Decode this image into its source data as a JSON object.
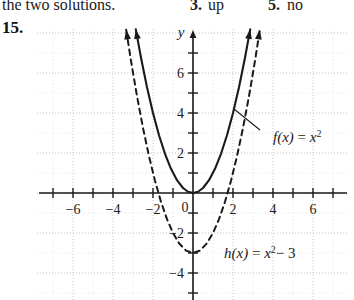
{
  "answer_key": {
    "trailing_text": "the two solutions.",
    "items": [
      {
        "number": "3.",
        "answer": "up"
      },
      {
        "number": "5.",
        "answer": "no"
      }
    ]
  },
  "exercise": {
    "number": "15."
  },
  "chart_data": {
    "type": "line",
    "title": "",
    "xlabel": "",
    "ylabel": "y",
    "xlim": [
      -7.8,
      7.8
    ],
    "ylim": [
      -6.0,
      8.2
    ],
    "grid": true,
    "grid_style": "dotted",
    "grid_spacing": 1,
    "axis_arrows": [
      "y-up",
      "y-down"
    ],
    "xticks": [
      -7,
      -6,
      -5,
      -4,
      -3,
      -2,
      -1,
      1,
      2,
      3,
      4,
      5,
      6,
      7
    ],
    "yticks": [
      -5,
      -4,
      -3,
      -2,
      -1,
      1,
      2,
      3,
      4,
      5,
      6,
      7
    ],
    "xticklabels": [
      {
        "value": -6,
        "text": "−6"
      },
      {
        "value": -4,
        "text": "−4"
      },
      {
        "value": -2,
        "text": "−2"
      },
      {
        "value": 2,
        "text": "2"
      },
      {
        "value": 4,
        "text": "4"
      },
      {
        "value": 6,
        "text": "6"
      }
    ],
    "yticklabels": [
      {
        "value": 6,
        "text": "6"
      },
      {
        "value": 4,
        "text": "4"
      },
      {
        "value": 2,
        "text": "2"
      },
      {
        "value": -2,
        "text": "−2"
      },
      {
        "value": -4,
        "text": "−4"
      }
    ],
    "origin_label": "0",
    "yaxis_label": "y",
    "series": [
      {
        "name": "f",
        "equation": "f(x) = x²",
        "label_text_main": "f(x)  =  x",
        "label_text_sup": "2",
        "style": "solid",
        "color": "#1a1a1a",
        "vertex": [
          0,
          0
        ],
        "x": [
          -2.86,
          -2.6,
          -2.3,
          -2.0,
          -1.7,
          -1.4,
          -1.1,
          -0.8,
          -0.5,
          -0.25,
          0,
          0.25,
          0.5,
          0.8,
          1.1,
          1.4,
          1.7,
          2.0,
          2.3,
          2.6,
          2.86
        ],
        "y": [
          8.18,
          6.76,
          5.29,
          4.0,
          2.89,
          1.96,
          1.21,
          0.64,
          0.25,
          0.0625,
          0,
          0.0625,
          0.25,
          0.64,
          1.21,
          1.96,
          2.89,
          4.0,
          5.29,
          6.76,
          8.18
        ],
        "arrow_ends": [
          [
            -2.86,
            8.18
          ],
          [
            2.86,
            8.18
          ]
        ],
        "leader_from": [
          3.35,
          3.15
        ],
        "leader_to": [
          2.05,
          4.2
        ]
      },
      {
        "name": "h",
        "equation": "h(x) = x² − 3",
        "label_text_main": "h(x)  =  x",
        "label_text_sup": "2",
        "label_text_tail": "− 3",
        "style": "dashed",
        "color": "#1a1a1a",
        "vertex": [
          0,
          -3
        ],
        "x": [
          -3.34,
          -3.1,
          -2.8,
          -2.5,
          -2.2,
          -1.9,
          -1.6,
          -1.3,
          -1.0,
          -0.7,
          -0.35,
          0,
          0.35,
          0.7,
          1.0,
          1.3,
          1.6,
          1.9,
          2.2,
          2.5,
          2.8,
          3.1,
          3.34
        ],
        "y": [
          8.16,
          6.61,
          4.84,
          3.25,
          1.84,
          0.61,
          -0.44,
          -1.31,
          -2.0,
          -2.51,
          -2.88,
          -3,
          -2.88,
          -2.51,
          -2.0,
          -1.31,
          -0.44,
          0.61,
          1.84,
          3.25,
          4.84,
          6.61,
          8.16
        ],
        "arrow_ends": [
          [
            -3.34,
            8.16
          ],
          [
            3.34,
            8.16
          ]
        ],
        "x_intercepts": [
          -1.732,
          1.732
        ]
      }
    ]
  }
}
